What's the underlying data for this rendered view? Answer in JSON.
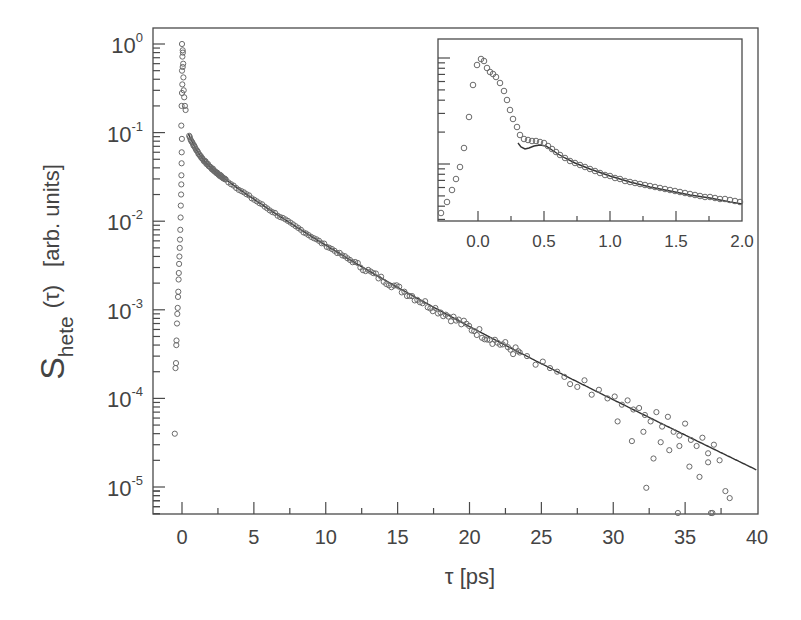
{
  "chart_data": [
    {
      "type": "scatter",
      "panel": "main",
      "title": "",
      "xlabel": "τ [ps]",
      "ylabel": "S_hete (τ) [arb. units]",
      "ylabel_parts": {
        "symbol": "S",
        "subscript": "hete",
        "arg": "(τ)",
        "units": "[arb. units]"
      },
      "xlim": [
        -2,
        40
      ],
      "ylim": [
        5e-06,
        1.5
      ],
      "yscale": "log",
      "grid": false,
      "legend": null,
      "x_ticks": [
        0,
        5,
        10,
        15,
        20,
        25,
        30,
        35,
        40
      ],
      "x_tick_labels": [
        "0",
        "5",
        "10",
        "15",
        "20",
        "25",
        "30",
        "35",
        "40"
      ],
      "y_ticks": [
        1,
        0.1,
        0.01,
        0.001,
        0.0001,
        1e-05
      ],
      "y_tick_labels": [
        {
          "base": "10",
          "exp": "0"
        },
        {
          "base": "10",
          "exp": "-1"
        },
        {
          "base": "10",
          "exp": "-2"
        },
        {
          "base": "10",
          "exp": "-3"
        },
        {
          "base": "10",
          "exp": "-4"
        },
        {
          "base": "10",
          "exp": "-5"
        }
      ],
      "series": [
        {
          "name": "data (open circles)",
          "marker": "open-circle",
          "rise_points": [
            [
              -0.5,
              4e-05
            ],
            [
              -0.45,
              0.00022
            ],
            [
              -0.42,
              0.00025
            ],
            [
              -0.4,
              0.0004
            ],
            [
              -0.38,
              0.00045
            ],
            [
              -0.35,
              0.0007
            ],
            [
              -0.33,
              0.0009
            ],
            [
              -0.3,
              0.00105
            ],
            [
              -0.28,
              0.0014
            ],
            [
              -0.26,
              0.0016
            ],
            [
              -0.24,
              0.0022
            ],
            [
              -0.22,
              0.0026
            ],
            [
              -0.2,
              0.0033
            ],
            [
              -0.18,
              0.004
            ],
            [
              -0.16,
              0.005
            ],
            [
              -0.14,
              0.0062
            ],
            [
              -0.12,
              0.008
            ],
            [
              -0.1,
              0.011
            ],
            [
              -0.08,
              0.015
            ],
            [
              -0.06,
              0.02
            ],
            [
              -0.05,
              0.026
            ],
            [
              -0.04,
              0.033
            ],
            [
              -0.03,
              0.045
            ],
            [
              -0.02,
              0.06
            ],
            [
              -0.01,
              0.085
            ],
            [
              -0.05,
              0.12
            ],
            [
              -0.03,
              0.2
            ],
            [
              0.0,
              0.28
            ],
            [
              0.02,
              0.35
            ],
            [
              0.0,
              0.5
            ],
            [
              0.05,
              0.55
            ],
            [
              0.03,
              0.72
            ],
            [
              0.06,
              0.8
            ],
            [
              0.0,
              1.0
            ],
            [
              0.05,
              0.85
            ],
            [
              0.08,
              0.6
            ],
            [
              0.1,
              0.42
            ],
            [
              0.12,
              0.3
            ],
            [
              0.15,
              0.25
            ],
            [
              0.2,
              0.2
            ],
            [
              0.25,
              0.18
            ]
          ],
          "tail_points": [
            [
              23.5,
              0.00033
            ],
            [
              24.0,
              0.0003
            ],
            [
              24.6,
              0.00024
            ],
            [
              25.1,
              0.00026
            ],
            [
              25.6,
              0.00022
            ],
            [
              26.1,
              0.0002
            ],
            [
              26.6,
              0.000175
            ],
            [
              27.0,
              0.000145
            ],
            [
              27.5,
              0.000135
            ],
            [
              28.0,
              0.00016
            ],
            [
              28.5,
              0.00011
            ],
            [
              29.0,
              0.000125
            ],
            [
              29.6,
              0.0001
            ],
            [
              30.1,
              0.000105
            ],
            [
              30.6,
              8.5e-05
            ],
            [
              31.0,
              9.5e-05
            ],
            [
              31.4,
              7.5e-05
            ],
            [
              31.8,
              7.8e-05
            ],
            [
              32.2,
              6.5e-05
            ],
            [
              32.6,
              5.5e-05
            ],
            [
              33.0,
              7e-05
            ],
            [
              33.4,
              4.8e-05
            ],
            [
              33.8,
              6.2e-05
            ],
            [
              34.2,
              4.2e-05
            ],
            [
              34.6,
              3.8e-05
            ],
            [
              35.0,
              5.2e-05
            ],
            [
              35.4,
              3.4e-05
            ],
            [
              35.8,
              2.9e-05
            ],
            [
              36.2,
              3.6e-05
            ],
            [
              36.6,
              2.4e-05
            ],
            [
              37.0,
              3e-05
            ],
            [
              37.4,
              2e-05
            ],
            [
              30.3,
              5.5e-05
            ],
            [
              31.3,
              3.3e-05
            ],
            [
              32.1,
              4.2e-05
            ],
            [
              32.8,
              2.1e-05
            ],
            [
              33.3,
              3.2e-05
            ],
            [
              33.9,
              2.6e-05
            ],
            [
              34.6,
              2.9e-05
            ],
            [
              35.3,
              1.7e-05
            ],
            [
              36.0,
              1.3e-05
            ],
            [
              36.6,
              1.9e-05
            ],
            [
              37.8,
              9e-06
            ],
            [
              38.1,
              7.5e-06
            ],
            [
              32.3,
              9.8e-06
            ],
            [
              34.5,
              5e-06
            ],
            [
              36.8,
              5e-06
            ],
            [
              36.9,
              5e-06
            ]
          ]
        },
        {
          "name": "fit (solid line)",
          "marker": "line",
          "model": "A1*exp(-t/t1)+A2*exp(-t/t2)+A3*exp(-t/t3)",
          "params": {
            "A1": 0.09,
            "t1": 0.55,
            "A2": 0.045,
            "t2": 3.2,
            "A3": 0.021,
            "t3": 5.55
          },
          "x_range": [
            0.45,
            40
          ],
          "value_at_40": 1.55e-05
        }
      ]
    },
    {
      "type": "scatter",
      "panel": "inset",
      "title": "",
      "xlim": [
        -0.3,
        2.0
      ],
      "yscale": "log",
      "x_ticks": [
        0.0,
        0.5,
        1.0,
        1.5,
        2.0
      ],
      "x_tick_labels": [
        "0.0",
        "0.5",
        "1.0",
        "1.5",
        "2.0"
      ],
      "y_tick_labels": [],
      "series": [
        {
          "name": "data (open circles)",
          "marker": "open-circle",
          "points_px": [
            [
              441,
              213
            ],
            [
              447,
              202
            ],
            [
              452,
              190
            ],
            [
              456,
              179
            ],
            [
              460,
              167
            ],
            [
              464,
              148
            ],
            [
              469,
              117
            ],
            [
              473,
              85
            ],
            [
              477,
              65
            ],
            [
              481,
              59
            ],
            [
              484,
              61
            ],
            [
              487,
              68
            ],
            [
              490,
              72
            ],
            [
              493,
              74
            ],
            [
              496,
              77
            ],
            [
              500,
              83
            ],
            [
              504,
              91
            ],
            [
              507,
              100
            ],
            [
              510,
              110
            ],
            [
              513,
              119
            ],
            [
              517,
              127
            ],
            [
              520,
              135
            ],
            [
              524,
              139
            ],
            [
              528,
              140
            ],
            [
              532,
              141
            ],
            [
              536,
              141
            ],
            [
              540,
              142
            ],
            [
              544,
              143
            ],
            [
              548,
              146
            ],
            [
              552,
              149
            ],
            [
              556,
              152
            ],
            [
              560,
              155
            ],
            [
              565,
              158
            ],
            [
              570,
              161
            ],
            [
              575,
              163
            ],
            [
              580,
              165
            ],
            [
              585,
              167
            ],
            [
              590,
              169
            ],
            [
              595,
              171
            ],
            [
              600,
              173
            ],
            [
              605,
              175
            ],
            [
              610,
              176
            ],
            [
              615,
              178
            ],
            [
              620,
              179
            ],
            [
              625,
              181
            ],
            [
              630,
              182
            ],
            [
              635,
              183
            ],
            [
              640,
              184
            ],
            [
              645,
              185
            ],
            [
              650,
              186
            ],
            [
              655,
              187
            ],
            [
              660,
              188
            ],
            [
              665,
              189
            ],
            [
              670,
              190
            ],
            [
              675,
              191
            ],
            [
              680,
              192
            ],
            [
              685,
              193
            ],
            [
              690,
              194
            ],
            [
              695,
              195
            ],
            [
              700,
              196
            ],
            [
              705,
              197
            ],
            [
              710,
              197
            ],
            [
              715,
              198
            ],
            [
              720,
              199
            ],
            [
              725,
              199
            ],
            [
              730,
              200
            ],
            [
              735,
              201
            ],
            [
              740,
              202
            ]
          ]
        },
        {
          "name": "fit (solid line)",
          "marker": "line",
          "path_px": [
            [
              518,
              143
            ],
            [
              521,
              147
            ],
            [
              525,
              149
            ],
            [
              529,
              148
            ],
            [
              534,
              146
            ],
            [
              540,
              145
            ],
            [
              546,
              146
            ],
            [
              552,
              150
            ],
            [
              558,
              154
            ],
            [
              565,
              158
            ],
            [
              575,
              163
            ],
            [
              590,
              169
            ],
            [
              610,
              176
            ],
            [
              630,
              182
            ],
            [
              650,
              187
            ],
            [
              670,
              191
            ],
            [
              690,
              195
            ],
            [
              710,
              198
            ],
            [
              730,
              202
            ],
            [
              742,
              204
            ]
          ]
        }
      ]
    }
  ]
}
